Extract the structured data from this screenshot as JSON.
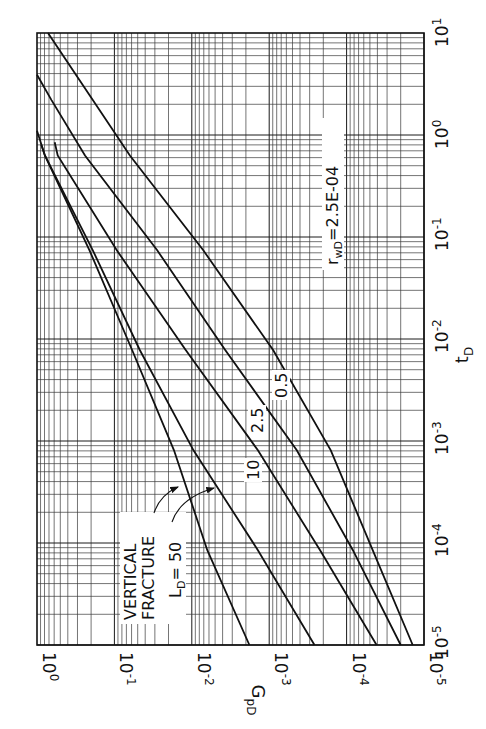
{
  "chart_data": {
    "type": "line",
    "orientation": "rotated-90-ccw",
    "title": "",
    "xlabel": "t_D",
    "ylabel": "G_pD",
    "xscale": "log",
    "yscale": "log",
    "xlim": [
      1e-05,
      10
    ],
    "ylim": [
      1e-05,
      1
    ],
    "grid": true,
    "x_ticks": [
      "10^-5",
      "10^-4",
      "10^-3",
      "10^-2",
      "10^-1",
      "10^0",
      "10^1"
    ],
    "y_ticks": [
      "10^0",
      "10^-1",
      "10^-2",
      "10^-3",
      "10^-4",
      "10^-5"
    ],
    "annotations": [
      "r_wD = 2.5E-04",
      "VERTICAL FRACTURE",
      "L_D = 50",
      "10",
      "2.5",
      "0.5"
    ],
    "series": [
      {
        "name": "Vertical fracture",
        "x": [
          0.8,
          0.63,
          0.074,
          0.0078,
          0.00081,
          8.5e-05,
          1e-05
        ],
        "y": [
          0.88,
          0.79,
          0.21,
          0.059,
          0.017,
          0.0063,
          0.0018
        ]
      },
      {
        "name": "L_D = 50",
        "x": [
          1.1,
          0.63,
          0.074,
          0.0078,
          0.00081,
          8.5e-05,
          1e-05
        ],
        "y": [
          1.0,
          0.79,
          0.19,
          0.047,
          0.0095,
          0.0014,
          0.00026
        ]
      },
      {
        "name": "L_D = 10",
        "x": [
          0.85,
          0.63,
          0.074,
          0.0078,
          0.00081,
          8.5e-05,
          1e-05
        ],
        "y": [
          0.59,
          0.54,
          0.093,
          0.012,
          0.0014,
          0.00022,
          4.1e-05
        ]
      },
      {
        "name": "L_D = 2.5",
        "x": [
          3.9,
          2.2,
          0.63,
          0.074,
          0.0078,
          0.00081,
          8.5e-05,
          1e-05
        ],
        "y": [
          1.0,
          0.65,
          0.24,
          0.028,
          0.0037,
          0.00044,
          8.3e-05,
          2e-05
        ]
      },
      {
        "name": "L_D = 0.5",
        "x": [
          10,
          2.2,
          0.63,
          0.074,
          0.0078,
          0.00081,
          8.5e-05,
          1e-05
        ],
        "y": [
          0.72,
          0.19,
          0.063,
          0.0071,
          0.00089,
          0.00016,
          4.6e-05,
          1.4e-05
        ]
      }
    ]
  },
  "labels": {
    "ylabel": "G",
    "ylabel_sub": "pD",
    "xlabel": "t",
    "xlabel_sub": "D",
    "rwd_prefix": "r",
    "rwd_sub": "wD",
    "rwd_value": "=2.5E-04",
    "vertical": "VERTICAL",
    "fracture": "FRACTURE",
    "ld_prefix": "L",
    "ld_sub": "D",
    "ld_value": "= 50",
    "curve_10": "10",
    "curve_2_5": "2.5",
    "curve_0_5": "0.5"
  },
  "ticks": {
    "g": [
      {
        "base": "10",
        "exp": "0"
      },
      {
        "base": "10",
        "exp": "-1"
      },
      {
        "base": "10",
        "exp": "-2"
      },
      {
        "base": "10",
        "exp": "-3"
      },
      {
        "base": "10",
        "exp": "-4"
      },
      {
        "base": "10",
        "exp": "-5"
      }
    ],
    "t": [
      {
        "base": "10",
        "exp": "-5"
      },
      {
        "base": "10",
        "exp": "-4"
      },
      {
        "base": "10",
        "exp": "-3"
      },
      {
        "base": "10",
        "exp": "-2"
      },
      {
        "base": "10",
        "exp": "-1"
      },
      {
        "base": "10",
        "exp": "0"
      },
      {
        "base": "10",
        "exp": "1"
      }
    ]
  }
}
